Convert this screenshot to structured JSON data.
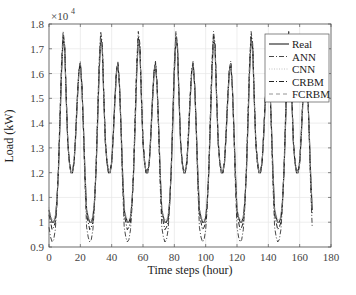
{
  "chart_data": {
    "type": "line",
    "title": "",
    "xlabel": "Time steps (hour)",
    "ylabel": "Load (kW)",
    "y_multiplier": "×10^4",
    "xlim": [
      0,
      180
    ],
    "ylim": [
      0.9,
      1.8
    ],
    "x_ticks": [
      0,
      20,
      40,
      60,
      80,
      100,
      120,
      140,
      160,
      180
    ],
    "y_ticks": [
      0.9,
      1.0,
      1.1,
      1.2,
      1.3,
      1.4,
      1.5,
      1.6,
      1.7,
      1.8
    ],
    "y_tick_labels": [
      "0.9",
      "1",
      "1.1",
      "1.2",
      "1.3",
      "1.4",
      "1.5",
      "1.6",
      "1.7",
      "1.8"
    ],
    "grid": true,
    "legend_position": "upper right",
    "x_range_hours": [
      0,
      168
    ],
    "daily_repeat_days": 7,
    "series": [
      {
        "name": "Real",
        "style": "solid",
        "daily_profile": [
          1.05,
          1.02,
          1.0,
          1.0,
          1.02,
          1.08,
          1.2,
          1.4,
          1.6,
          1.74,
          1.7,
          1.5,
          1.32,
          1.24,
          1.2,
          1.2,
          1.24,
          1.34,
          1.48,
          1.6,
          1.64,
          1.55,
          1.38,
          1.2
        ]
      },
      {
        "name": "ANN",
        "style": "dashdot",
        "daily_profile": [
          0.98,
          0.94,
          0.92,
          0.93,
          0.97,
          1.06,
          1.22,
          1.44,
          1.64,
          1.77,
          1.72,
          1.52,
          1.33,
          1.25,
          1.21,
          1.21,
          1.25,
          1.36,
          1.5,
          1.61,
          1.65,
          1.56,
          1.36,
          1.15
        ]
      },
      {
        "name": "CNN",
        "style": "dotted",
        "daily_profile": [
          1.06,
          1.03,
          1.01,
          1.01,
          1.03,
          1.09,
          1.21,
          1.41,
          1.6,
          1.73,
          1.69,
          1.49,
          1.31,
          1.24,
          1.2,
          1.2,
          1.24,
          1.34,
          1.47,
          1.59,
          1.63,
          1.54,
          1.37,
          1.21
        ]
      },
      {
        "name": "CRBM",
        "style": "dashdot",
        "daily_profile": [
          1.03,
          1.0,
          0.97,
          0.98,
          1.0,
          1.07,
          1.21,
          1.42,
          1.62,
          1.75,
          1.71,
          1.51,
          1.32,
          1.24,
          1.2,
          1.2,
          1.24,
          1.35,
          1.49,
          1.61,
          1.64,
          1.55,
          1.37,
          1.18
        ]
      },
      {
        "name": "FCRBM",
        "style": "dashed",
        "daily_profile": [
          1.05,
          1.02,
          1.0,
          1.0,
          1.02,
          1.08,
          1.2,
          1.4,
          1.6,
          1.74,
          1.7,
          1.5,
          1.32,
          1.24,
          1.2,
          1.2,
          1.24,
          1.34,
          1.48,
          1.6,
          1.64,
          1.55,
          1.38,
          1.2
        ]
      }
    ],
    "legend": [
      "Real",
      "ANN",
      "CNN",
      "CRBM",
      "FCRBM"
    ]
  }
}
